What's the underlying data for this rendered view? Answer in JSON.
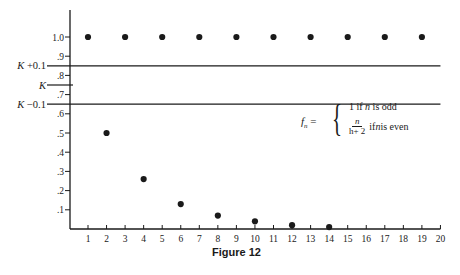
{
  "caption": "Figure 12",
  "formula": {
    "lhs_base": "f",
    "lhs_sub": "n",
    "lhs_eq": " =",
    "case1_value": "1 if ",
    "case1_var": "n",
    "case1_cond": " is odd",
    "case2_num": "n",
    "case2_den": "h+ 2",
    "case2_pre": "if ",
    "case2_var": "n",
    "case2_cond": " is even"
  },
  "colors": {
    "ink": "#1a1a1a",
    "background": "#ffffff"
  },
  "chart_data": {
    "type": "scatter",
    "title": "Figure 12",
    "xlabel": "",
    "ylabel": "",
    "x_ticks": [
      1,
      2,
      3,
      4,
      5,
      6,
      7,
      8,
      9,
      10,
      11,
      12,
      13,
      14,
      15,
      16,
      17,
      18,
      19,
      20
    ],
    "y_ticks": [
      {
        "value": 0.1,
        "label": ".1"
      },
      {
        "value": 0.2,
        "label": ".2"
      },
      {
        "value": 0.3,
        "label": ".3"
      },
      {
        "value": 0.4,
        "label": ".4"
      },
      {
        "value": 0.5,
        "label": ".5"
      },
      {
        "value": 0.6,
        "label": ".6"
      },
      {
        "value": 0.7,
        "label": ".7"
      },
      {
        "value": 0.8,
        "label": ".8"
      },
      {
        "value": 0.9,
        "label": ".9"
      },
      {
        "value": 1.0,
        "label": "1.0"
      }
    ],
    "xlim": [
      0,
      20
    ],
    "ylim": [
      0,
      1.15
    ],
    "grid": false,
    "reference_lines": [
      {
        "label": "K + 0.1",
        "y": 0.85,
        "full_width": true
      },
      {
        "label": "K",
        "y": 0.75,
        "full_width": false
      },
      {
        "label": "K − 0.1",
        "y": 0.65,
        "full_width": true
      }
    ],
    "series": [
      {
        "name": "f_n",
        "points": [
          {
            "x": 1,
            "y": 1.0
          },
          {
            "x": 2,
            "y": 0.5
          },
          {
            "x": 3,
            "y": 1.0
          },
          {
            "x": 4,
            "y": 0.26
          },
          {
            "x": 5,
            "y": 1.0
          },
          {
            "x": 6,
            "y": 0.13
          },
          {
            "x": 7,
            "y": 1.0
          },
          {
            "x": 8,
            "y": 0.07
          },
          {
            "x": 9,
            "y": 1.0
          },
          {
            "x": 10,
            "y": 0.04
          },
          {
            "x": 11,
            "y": 1.0
          },
          {
            "x": 12,
            "y": 0.02
          },
          {
            "x": 13,
            "y": 1.0
          },
          {
            "x": 14,
            "y": 0.01
          },
          {
            "x": 15,
            "y": 1.0
          },
          {
            "x": 17,
            "y": 1.0
          },
          {
            "x": 19,
            "y": 1.0
          }
        ]
      }
    ],
    "annotations": [
      "f_n = { 1 if n is odd ; n/(h+2) if n is even }"
    ]
  }
}
